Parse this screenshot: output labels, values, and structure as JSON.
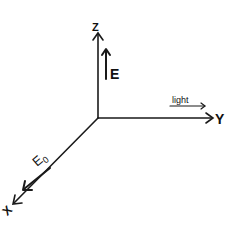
{
  "diagram": {
    "type": "3d-coordinate-axes",
    "origin": {
      "x": 98,
      "y": 118
    },
    "axes": {
      "z": {
        "label": "Z",
        "direction": "up"
      },
      "y": {
        "label": "Y",
        "direction": "right"
      },
      "x": {
        "label": "X",
        "direction": "down-left"
      }
    },
    "vectors": {
      "e_field": {
        "label": "E",
        "direction": "up (parallel to Z)"
      },
      "e0_field": {
        "label": "E",
        "subscript": "0",
        "direction": "toward -X (along X axis)"
      },
      "light": {
        "label": "light",
        "direction": "along +Y"
      }
    }
  }
}
